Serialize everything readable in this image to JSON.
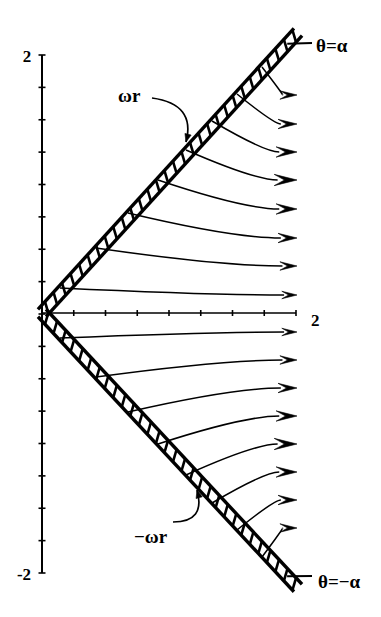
{
  "figure": {
    "type": "vector-field-diagram",
    "background_color": "#ffffff",
    "ink_color": "#000000",
    "width": 381,
    "height": 617
  },
  "axes": {
    "origin": {
      "x": 42,
      "y": 313
    },
    "vertical": {
      "x": 42,
      "y_top": 55,
      "y_bottom": 573,
      "tick_count": 16,
      "tick_half_len": 3.5,
      "top_label": "2",
      "bottom_label": "-2",
      "top_label_pos": {
        "x": 27,
        "y": 62
      },
      "bottom_label_pos": {
        "x": 24,
        "y": 580
      }
    },
    "horizontal": {
      "y": 313,
      "x_left": 42,
      "x_right": 296,
      "tick_count": 8,
      "tick_half_len": 3,
      "right_label": "2",
      "right_label_pos": {
        "x": 311,
        "y": 326
      }
    }
  },
  "walls": [
    {
      "name": "upper-wall",
      "from": {
        "x": 42,
        "y": 313
      },
      "to": {
        "x": 298,
        "y": 32
      },
      "band_width": 11,
      "hatch_count": 30,
      "overshoot": {
        "x": 312,
        "y": 43
      },
      "label": "θ=α",
      "label_pos": {
        "x": 316,
        "y": 52
      }
    },
    {
      "name": "lower-wall",
      "from": {
        "x": 42,
        "y": 313
      },
      "to": {
        "x": 298,
        "y": 588
      },
      "band_width": 11,
      "hatch_count": 30,
      "overshoot": {
        "x": 312,
        "y": 576
      },
      "label": "θ=−α",
      "label_pos": {
        "x": 318,
        "y": 588
      }
    }
  ],
  "annotations": [
    {
      "name": "omega-r",
      "text": "ωr",
      "text_pos": {
        "x": 118,
        "y": 102
      },
      "leader_start": {
        "x": 152,
        "y": 98
      },
      "leader_ctrl": {
        "x": 196,
        "y": 104
      },
      "leader_end": {
        "x": 186,
        "y": 142
      }
    },
    {
      "name": "negative-omega-r",
      "text": "−ωr",
      "text_pos": {
        "x": 134,
        "y": 543
      },
      "leader_start": {
        "x": 173,
        "y": 522
      },
      "leader_ctrl": {
        "x": 206,
        "y": 522
      },
      "leader_end": {
        "x": 197,
        "y": 490
      }
    }
  ],
  "arrow_field": {
    "description": "Curved velocity vectors emanating perpendicular from each wall and turning to align with the radial direction at the tip",
    "tip_x": 297,
    "upper_tips_y": [
      95,
      124,
      152,
      180,
      209,
      238,
      266,
      295
    ],
    "lower_tips_y": [
      332,
      360,
      388,
      416,
      444,
      472,
      500,
      528
    ],
    "head_sizes": [
      9,
      10,
      11,
      12,
      11,
      10,
      9,
      8
    ],
    "upper_origins": [
      {
        "x": 262,
        "y": 67
      },
      {
        "x": 237,
        "y": 94
      },
      {
        "x": 212,
        "y": 121
      },
      {
        "x": 186,
        "y": 150
      },
      {
        "x": 158,
        "y": 180
      },
      {
        "x": 128,
        "y": 213
      },
      {
        "x": 96,
        "y": 248
      },
      {
        "x": 60,
        "y": 288
      }
    ],
    "lower_origins": [
      {
        "x": 60,
        "y": 338
      },
      {
        "x": 96,
        "y": 377
      },
      {
        "x": 128,
        "y": 412
      },
      {
        "x": 158,
        "y": 444
      },
      {
        "x": 186,
        "y": 475
      },
      {
        "x": 212,
        "y": 503
      },
      {
        "x": 237,
        "y": 530
      },
      {
        "x": 262,
        "y": 557
      }
    ]
  }
}
